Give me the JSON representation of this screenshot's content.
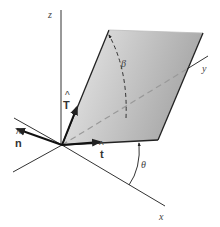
{
  "figure": {
    "axes": {
      "x": {
        "label": "x"
      },
      "y": {
        "label": "y"
      },
      "z": {
        "label": "z"
      }
    },
    "vectors": {
      "n": {
        "label": "n",
        "hat": "^"
      },
      "t": {
        "label": "t",
        "hat": "^"
      },
      "T": {
        "label": "T",
        "hat": "^"
      }
    },
    "angles": {
      "beta": {
        "label": "β"
      },
      "theta": {
        "label": "θ"
      }
    },
    "colors": {
      "plane_fill_light": "#e8e8e8",
      "plane_fill_dark": "#a9a9a9",
      "line": "#333333",
      "dashed": "#888888"
    }
  }
}
